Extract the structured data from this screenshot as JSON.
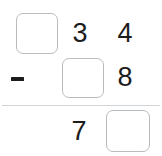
{
  "problem": {
    "type": "vertical-subtraction",
    "operator": "−",
    "minuend": {
      "blank_box": "",
      "digits": [
        "3",
        "4"
      ]
    },
    "subtrahend": {
      "blank_box": "",
      "digits": [
        "8"
      ]
    },
    "result": {
      "digits": [
        "7"
      ],
      "blank_box": ""
    }
  },
  "colors": {
    "box_border": "#b9bcbe",
    "digit": "#1c1c1c",
    "rule": "#d2d5d7",
    "background": "#ffffff"
  }
}
